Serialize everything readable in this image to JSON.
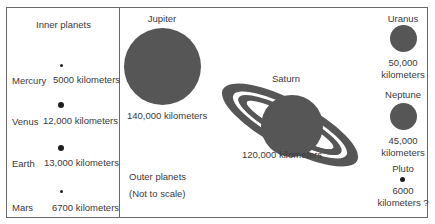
{
  "diagram": {
    "colors": {
      "planet": "#565656",
      "small_planet": "#1e1e1e",
      "border": "#6a6a6a",
      "text": "#3a3a3a"
    },
    "inner_panel": {
      "title": "Inner planets",
      "planets": [
        {
          "name": "Mercury",
          "diameter": "5000 kilometers"
        },
        {
          "name": "Venus",
          "diameter": "12,000 kilometers"
        },
        {
          "name": "Earth",
          "diameter": "13,000 kilometers"
        },
        {
          "name": "Mars",
          "diameter": "6700 kilometers"
        }
      ]
    },
    "outer_panel": {
      "title": "Outer planets",
      "note": "(Not to scale)",
      "planets": [
        {
          "name": "Jupiter",
          "diameter": "140,000 kilometers"
        },
        {
          "name": "Saturn",
          "diameter": "120,000 kilometers"
        },
        {
          "name": "Uranus",
          "diameter_line1": "50,000",
          "diameter_line2": "kilometers"
        },
        {
          "name": "Neptune",
          "diameter_line1": "45,000",
          "diameter_line2": "kilometers"
        },
        {
          "name": "Pluto",
          "diameter_line1": "6000",
          "diameter_line2": "kilometers ?"
        }
      ]
    }
  }
}
